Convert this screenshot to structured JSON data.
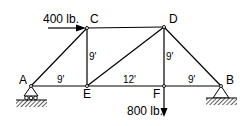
{
  "diagram": {
    "type": "truss",
    "nodes": {
      "A": {
        "label": "A",
        "x": 31,
        "y": 86
      },
      "B": {
        "label": "B",
        "x": 221,
        "y": 86
      },
      "C": {
        "label": "C",
        "x": 87,
        "y": 28
      },
      "D": {
        "label": "D",
        "x": 164,
        "y": 27
      },
      "E": {
        "label": "E",
        "x": 87,
        "y": 86
      },
      "F": {
        "label": "F",
        "x": 164,
        "y": 86
      }
    },
    "members": [
      [
        "A",
        "C"
      ],
      [
        "A",
        "E"
      ],
      [
        "C",
        "E"
      ],
      [
        "C",
        "D"
      ],
      [
        "E",
        "D"
      ],
      [
        "E",
        "F"
      ],
      [
        "D",
        "F"
      ],
      [
        "D",
        "B"
      ],
      [
        "F",
        "B"
      ]
    ],
    "dimensions": {
      "AE": "9'",
      "EF": "12'",
      "FB": "9'",
      "CE": "9'",
      "DF": "9'"
    },
    "loads": {
      "horizontal": {
        "label": "400 lb.",
        "at": "C",
        "direction": "right"
      },
      "vertical": {
        "label": "800 lb.",
        "at": "F",
        "direction": "down"
      }
    },
    "supports": [
      {
        "at": "A",
        "type": "roller"
      },
      {
        "at": "B",
        "type": "pin"
      }
    ]
  }
}
